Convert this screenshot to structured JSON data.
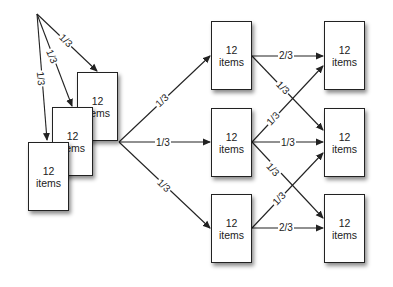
{
  "diagram": {
    "type": "flow-diagram",
    "node_count_text": "12",
    "node_unit_text": "items",
    "colors": {
      "stroke": "#222222",
      "background": "#ffffff",
      "box_fill": "#ffffff"
    },
    "nodes": [
      {
        "id": "stack-back",
        "line1": "12",
        "line2": "items"
      },
      {
        "id": "stack-middle",
        "line1": "12",
        "line2": "items"
      },
      {
        "id": "stack-front",
        "line1": "12",
        "line2": "items"
      },
      {
        "id": "mid-top",
        "line1": "12",
        "line2": "items"
      },
      {
        "id": "mid-center",
        "line1": "12",
        "line2": "items"
      },
      {
        "id": "mid-bottom",
        "line1": "12",
        "line2": "items"
      },
      {
        "id": "right-top",
        "line1": "12",
        "line2": "items"
      },
      {
        "id": "right-center",
        "line1": "12",
        "line2": "items"
      },
      {
        "id": "right-bottom",
        "line1": "12",
        "line2": "items"
      }
    ],
    "edges": [
      {
        "from": "source",
        "to": "stack-back",
        "label": "1/3"
      },
      {
        "from": "source",
        "to": "stack-middle",
        "label": "1/3"
      },
      {
        "from": "source",
        "to": "stack-front",
        "label": "1/3"
      },
      {
        "from": "stack-back",
        "to": "mid-top",
        "label": "1/3"
      },
      {
        "from": "stack-back",
        "to": "mid-center",
        "label": "1/3"
      },
      {
        "from": "stack-back",
        "to": "mid-bottom",
        "label": "1/3"
      },
      {
        "from": "mid-top",
        "to": "right-top",
        "label": "2/3"
      },
      {
        "from": "mid-top",
        "to": "right-center",
        "label": "1/3"
      },
      {
        "from": "mid-center",
        "to": "right-top",
        "label": "1/3"
      },
      {
        "from": "mid-center",
        "to": "right-center",
        "label": "1/3"
      },
      {
        "from": "mid-center",
        "to": "right-bottom",
        "label": "1/3"
      },
      {
        "from": "mid-bottom",
        "to": "right-center",
        "label": "1/3"
      },
      {
        "from": "mid-bottom",
        "to": "right-bottom",
        "label": "2/3"
      }
    ]
  }
}
